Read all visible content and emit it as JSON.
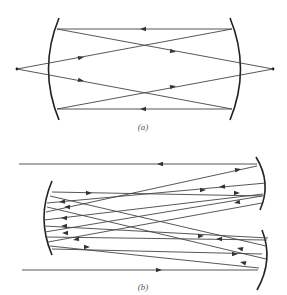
{
  "figure": {
    "panels": [
      {
        "id": "a",
        "caption": "(a)",
        "description": "Two concave mirrors facing each other with point foci outside; rays cross forming an X pattern"
      },
      {
        "id": "b",
        "caption": "(b)",
        "description": "Multipass arrangement: one large concave mirror on the left and two smaller concave mirrors on the right; beam enters at top and exits at bottom after multiple reflections"
      }
    ],
    "colors": {
      "line": "#444444",
      "mirror": "#222222",
      "background": "#ffffff"
    }
  }
}
